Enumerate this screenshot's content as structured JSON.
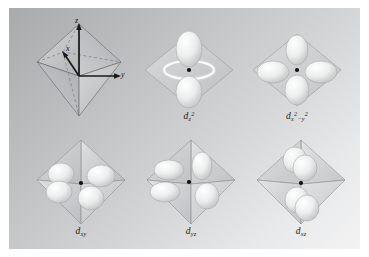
{
  "figure": {
    "background_top_left": "#a8aaac",
    "background_bottom_right": "#f3f3f4",
    "border_color": "#ffffff",
    "orbital_surface_color": "#e9eaea",
    "octahedron_color": "#c9cbcc",
    "axis_color": "#1a1a1a",
    "nucleus_color": "#111111"
  },
  "panels": [
    {
      "id": "octahedron-axes",
      "caption": "",
      "caption_plain": "",
      "axes": [
        {
          "name": "z",
          "label": "z"
        },
        {
          "name": "x",
          "label": "x"
        },
        {
          "name": "y",
          "label": "y"
        }
      ]
    },
    {
      "id": "d-z2",
      "caption_base": "d",
      "caption_sub": "z",
      "caption_sup": "2",
      "caption_plain": "dz2",
      "description": "two lobes along z with equatorial torus"
    },
    {
      "id": "d-x2-y2",
      "caption_base": "d",
      "caption_sub_a": "x",
      "caption_sup_a": "2",
      "caption_minus": "−",
      "caption_sub_b": "y",
      "caption_sup_b": "2",
      "caption_plain": "dx2-y2",
      "description": "four lobes along x and y axes"
    },
    {
      "id": "d-xy",
      "caption_base": "d",
      "caption_sub": "xy",
      "caption_plain": "dxy",
      "description": "four lobes between x and y axes"
    },
    {
      "id": "d-yz",
      "caption_base": "d",
      "caption_sub": "yz",
      "caption_plain": "dyz",
      "description": "four lobes between y and z axes"
    },
    {
      "id": "d-xz",
      "caption_base": "d",
      "caption_sub": "xz",
      "caption_plain": "dxz",
      "description": "four lobes between x and z axes"
    }
  ]
}
